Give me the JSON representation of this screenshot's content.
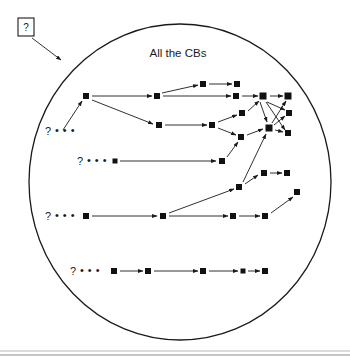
{
  "figure": {
    "type": "diagram",
    "caption_title": "All the CBs",
    "callout": {
      "label": "?",
      "target_x": 63,
      "target_y": 62
    },
    "boundary": {
      "shape": "ellipse",
      "cx": 180,
      "cy": 182,
      "rx": 151,
      "ry": 158
    },
    "row_markers": [
      {
        "qmark": "?",
        "dots": "• • •",
        "x": 48,
        "y": 131
      },
      {
        "qmark": "?",
        "dots": "• • •",
        "x": 80,
        "y": 161
      },
      {
        "qmark": "?",
        "dots": "• • •",
        "x": 48,
        "y": 216
      },
      {
        "qmark": "?",
        "dots": "• • •",
        "x": 73,
        "y": 271
      }
    ],
    "nodes": [
      {
        "id": "n1",
        "x": 86,
        "y": 96,
        "s": 6
      },
      {
        "id": "n2",
        "x": 157,
        "y": 96,
        "s": 6
      },
      {
        "id": "n3",
        "x": 203,
        "y": 84,
        "s": 6
      },
      {
        "id": "n4",
        "x": 237,
        "y": 84,
        "s": 6
      },
      {
        "id": "n5",
        "x": 236,
        "y": 96,
        "s": 6
      },
      {
        "id": "n6",
        "x": 263,
        "y": 96,
        "s": 7
      },
      {
        "id": "n7",
        "x": 288,
        "y": 96,
        "s": 7
      },
      {
        "id": "n8",
        "x": 159,
        "y": 125,
        "s": 6
      },
      {
        "id": "n9",
        "x": 212,
        "y": 125,
        "s": 6
      },
      {
        "id": "n10",
        "x": 242,
        "y": 113,
        "s": 6
      },
      {
        "id": "n11",
        "x": 289,
        "y": 113,
        "s": 6
      },
      {
        "id": "n12",
        "x": 241,
        "y": 137,
        "s": 6
      },
      {
        "id": "n13",
        "x": 269,
        "y": 128,
        "s": 7
      },
      {
        "id": "n14",
        "x": 288,
        "y": 133,
        "s": 6
      },
      {
        "id": "n15",
        "x": 115,
        "y": 161,
        "s": 5
      },
      {
        "id": "n16",
        "x": 222,
        "y": 161,
        "s": 6
      },
      {
        "id": "n17",
        "x": 239,
        "y": 187,
        "s": 6
      },
      {
        "id": "n18",
        "x": 264,
        "y": 173,
        "s": 6
      },
      {
        "id": "n19",
        "x": 287,
        "y": 173,
        "s": 6
      },
      {
        "id": "n20",
        "x": 297,
        "y": 192,
        "s": 6
      },
      {
        "id": "n21",
        "x": 86,
        "y": 216,
        "s": 6
      },
      {
        "id": "n22",
        "x": 163,
        "y": 216,
        "s": 6
      },
      {
        "id": "n23",
        "x": 233,
        "y": 216,
        "s": 6
      },
      {
        "id": "n24",
        "x": 265,
        "y": 216,
        "s": 6
      },
      {
        "id": "n25",
        "x": 114,
        "y": 271,
        "s": 6
      },
      {
        "id": "n26",
        "x": 148,
        "y": 271,
        "s": 6
      },
      {
        "id": "n27",
        "x": 203,
        "y": 271,
        "s": 6
      },
      {
        "id": "n28",
        "x": 243,
        "y": 271,
        "s": 5
      },
      {
        "id": "n29",
        "x": 265,
        "y": 271,
        "s": 6
      }
    ],
    "edges": [
      {
        "from": "seed1",
        "to": "n1",
        "x1": 63,
        "y1": 130,
        "x2": 82,
        "y2": 101
      },
      {
        "from": "n1",
        "to": "n2",
        "x1": 92,
        "y1": 96,
        "x2": 152,
        "y2": 96
      },
      {
        "from": "n1",
        "to": "n8",
        "x1": 92,
        "y1": 100,
        "x2": 153,
        "y2": 124
      },
      {
        "from": "n2",
        "to": "n3",
        "x1": 162,
        "y1": 93,
        "x2": 198,
        "y2": 85
      },
      {
        "from": "n2",
        "to": "n5",
        "x1": 163,
        "y1": 96,
        "x2": 231,
        "y2": 96
      },
      {
        "from": "n3",
        "to": "n4",
        "x1": 209,
        "y1": 84,
        "x2": 232,
        "y2": 84
      },
      {
        "from": "n5",
        "to": "n6",
        "x1": 242,
        "y1": 96,
        "x2": 258,
        "y2": 96
      },
      {
        "from": "n6",
        "to": "n7",
        "x1": 270,
        "y1": 96,
        "x2": 283,
        "y2": 96
      },
      {
        "from": "n8",
        "to": "n9",
        "x1": 165,
        "y1": 125,
        "x2": 207,
        "y2": 125
      },
      {
        "from": "n9",
        "to": "n10",
        "x1": 218,
        "y1": 122,
        "x2": 237,
        "y2": 115
      },
      {
        "from": "n9",
        "to": "n12",
        "x1": 218,
        "y1": 128,
        "x2": 236,
        "y2": 135
      },
      {
        "from": "n10",
        "to": "n6",
        "x1": 248,
        "y1": 111,
        "x2": 259,
        "y2": 101
      },
      {
        "from": "n6",
        "to": "n11",
        "x1": 267,
        "y1": 102,
        "x2": 285,
        "y2": 110
      },
      {
        "from": "n6",
        "to": "n14",
        "x1": 266,
        "y1": 102,
        "x2": 285,
        "y2": 130
      },
      {
        "from": "n6",
        "to": "n13",
        "x1": 260,
        "y1": 102,
        "x2": 267,
        "y2": 122
      },
      {
        "from": "n13",
        "to": "n7",
        "x1": 272,
        "y1": 123,
        "x2": 286,
        "y2": 101
      },
      {
        "from": "n13",
        "to": "n11",
        "x1": 274,
        "y1": 125,
        "x2": 285,
        "y2": 116
      },
      {
        "from": "n12",
        "to": "n13",
        "x1": 247,
        "y1": 135,
        "x2": 263,
        "y2": 129
      },
      {
        "from": "n13",
        "to": "n14",
        "x1": 275,
        "y1": 130,
        "x2": 283,
        "y2": 132
      },
      {
        "from": "n15",
        "to": "n16",
        "x1": 120,
        "y1": 161,
        "x2": 216,
        "y2": 161
      },
      {
        "from": "n16",
        "to": "n12",
        "x1": 227,
        "y1": 157,
        "x2": 238,
        "y2": 142
      },
      {
        "from": "n17",
        "to": "n13",
        "x1": 243,
        "y1": 182,
        "x2": 266,
        "y2": 134
      },
      {
        "from": "n17",
        "to": "n18",
        "x1": 245,
        "y1": 184,
        "x2": 258,
        "y2": 175
      },
      {
        "from": "n18",
        "to": "n19",
        "x1": 270,
        "y1": 173,
        "x2": 282,
        "y2": 173
      },
      {
        "from": "n21",
        "to": "n22",
        "x1": 92,
        "y1": 216,
        "x2": 157,
        "y2": 216
      },
      {
        "from": "n22",
        "to": "n17",
        "x1": 169,
        "y1": 213,
        "x2": 234,
        "y2": 189
      },
      {
        "from": "n22",
        "to": "n23",
        "x1": 169,
        "y1": 216,
        "x2": 228,
        "y2": 216
      },
      {
        "from": "n23",
        "to": "n24",
        "x1": 239,
        "y1": 216,
        "x2": 260,
        "y2": 216
      },
      {
        "from": "n24",
        "to": "n20",
        "x1": 271,
        "y1": 213,
        "x2": 293,
        "y2": 197
      },
      {
        "from": "n25",
        "to": "n26",
        "x1": 120,
        "y1": 271,
        "x2": 143,
        "y2": 271
      },
      {
        "from": "n26",
        "to": "n27",
        "x1": 154,
        "y1": 271,
        "x2": 198,
        "y2": 271
      },
      {
        "from": "n27",
        "to": "n28",
        "x1": 209,
        "y1": 271,
        "x2": 238,
        "y2": 271
      },
      {
        "from": "n28",
        "to": "n29",
        "x1": 248,
        "y1": 271,
        "x2": 260,
        "y2": 271
      }
    ]
  }
}
